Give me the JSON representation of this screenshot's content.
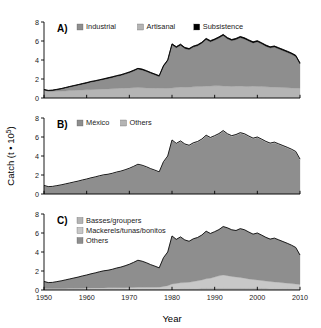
{
  "figure": {
    "xlabel": "Year",
    "ylabel_parts": {
      "main": "Catch (t ",
      "dot": "• 10",
      "exp": "5",
      "close": ")"
    },
    "ylabel_full": "Catch (t • 10⁵)",
    "x_ticks": [
      "1950",
      "1960",
      "1970",
      "1980",
      "1990",
      "2000",
      "2010"
    ],
    "x_tick_values": [
      1950,
      1960,
      1970,
      1980,
      1990,
      2000,
      2010
    ],
    "y_ticks": [
      "0",
      "2",
      "4",
      "6",
      "8"
    ],
    "y_tick_values": [
      0,
      2,
      4,
      6,
      8
    ],
    "xlim": [
      1950,
      2010
    ],
    "ylim": [
      0,
      8
    ],
    "grid": "off",
    "legend_position": "top-left inside panel"
  },
  "colors": {
    "fill_dark": "#7c7c7c",
    "fill_mid": "#8e8e8e",
    "fill_light": "#b4b4b4",
    "fill_lighter": "#c8c8c8",
    "black": "#000000",
    "axis": "#000000",
    "background": "#ffffff"
  },
  "chart_data": [
    {
      "type": "area",
      "panel": "A",
      "tag": "A)",
      "title": "",
      "xlabel": "",
      "ylabel": "Catch (t • 10⁵)",
      "xlim": [
        1950,
        2010
      ],
      "ylim": [
        0,
        8
      ],
      "stacked": true,
      "legend": [
        "Industrial",
        "Artisanal",
        "Subsistence"
      ],
      "legend_colors": [
        "#8e8e8e",
        "#b4b4b4",
        "#000000"
      ],
      "x": [
        1950,
        1951,
        1952,
        1953,
        1954,
        1955,
        1956,
        1957,
        1958,
        1959,
        1960,
        1961,
        1962,
        1963,
        1964,
        1965,
        1966,
        1967,
        1968,
        1969,
        1970,
        1971,
        1972,
        1973,
        1974,
        1975,
        1976,
        1977,
        1978,
        1979,
        1980,
        1981,
        1982,
        1983,
        1984,
        1985,
        1986,
        1987,
        1988,
        1989,
        1990,
        1991,
        1992,
        1993,
        1994,
        1995,
        1996,
        1997,
        1998,
        1999,
        2000,
        2001,
        2002,
        2003,
        2004,
        2005,
        2006,
        2007,
        2008,
        2009,
        2010
      ],
      "series": [
        {
          "name": "Artisanal",
          "color": "#b4b4b4",
          "values": [
            0.85,
            0.7,
            0.68,
            0.7,
            0.72,
            0.75,
            0.78,
            0.8,
            0.82,
            0.84,
            0.86,
            0.88,
            0.9,
            0.92,
            0.94,
            0.96,
            0.98,
            1.0,
            1.02,
            1.04,
            1.06,
            1.08,
            1.1,
            1.08,
            1.06,
            1.05,
            1.04,
            1.03,
            1.02,
            1.02,
            1.05,
            1.1,
            1.14,
            1.12,
            1.14,
            1.18,
            1.2,
            1.22,
            1.24,
            1.26,
            1.28,
            1.3,
            1.26,
            1.24,
            1.22,
            1.24,
            1.26,
            1.22,
            1.2,
            1.24,
            1.22,
            1.2,
            1.18,
            1.16,
            1.14,
            1.12,
            1.1,
            1.08,
            1.06,
            1.04,
            1.02
          ]
        },
        {
          "name": "Industrial",
          "color": "#8e8e8e",
          "values": [
            0.0,
            0.05,
            0.1,
            0.16,
            0.22,
            0.3,
            0.38,
            0.46,
            0.54,
            0.62,
            0.7,
            0.8,
            0.86,
            0.94,
            1.02,
            1.1,
            1.18,
            1.28,
            1.36,
            1.48,
            1.6,
            1.76,
            1.94,
            1.88,
            1.74,
            1.56,
            1.4,
            1.24,
            2.3,
            2.9,
            4.55,
            4.2,
            4.42,
            4.1,
            3.96,
            4.18,
            4.3,
            4.55,
            4.92,
            4.66,
            4.82,
            5.02,
            5.32,
            5.0,
            4.82,
            4.92,
            5.1,
            5.0,
            4.8,
            4.56,
            4.7,
            4.5,
            4.28,
            4.12,
            4.22,
            4.06,
            3.9,
            3.74,
            3.56,
            3.34,
            2.56
          ]
        },
        {
          "name": "Subsistence",
          "color": "#000000",
          "values": [
            0.05,
            0.05,
            0.05,
            0.05,
            0.05,
            0.05,
            0.05,
            0.05,
            0.05,
            0.06,
            0.06,
            0.06,
            0.06,
            0.06,
            0.06,
            0.07,
            0.07,
            0.07,
            0.07,
            0.07,
            0.08,
            0.08,
            0.08,
            0.08,
            0.08,
            0.08,
            0.08,
            0.08,
            0.09,
            0.09,
            0.1,
            0.1,
            0.1,
            0.1,
            0.1,
            0.1,
            0.1,
            0.1,
            0.11,
            0.11,
            0.11,
            0.11,
            0.11,
            0.11,
            0.11,
            0.11,
            0.11,
            0.11,
            0.11,
            0.11,
            0.11,
            0.11,
            0.11,
            0.11,
            0.11,
            0.11,
            0.11,
            0.11,
            0.11,
            0.11,
            0.11
          ]
        }
      ]
    },
    {
      "type": "area",
      "panel": "B",
      "tag": "B)",
      "title": "",
      "xlabel": "",
      "ylabel": "Catch (t • 10⁵)",
      "xlim": [
        1950,
        2010
      ],
      "ylim": [
        0,
        8
      ],
      "stacked": true,
      "legend": [
        "México",
        "Others"
      ],
      "legend_colors": [
        "#8e8e8e",
        "#b4b4b4"
      ],
      "x": [
        1950,
        1951,
        1952,
        1953,
        1954,
        1955,
        1956,
        1957,
        1958,
        1959,
        1960,
        1961,
        1962,
        1963,
        1964,
        1965,
        1966,
        1967,
        1968,
        1969,
        1970,
        1971,
        1972,
        1973,
        1974,
        1975,
        1976,
        1977,
        1978,
        1979,
        1980,
        1981,
        1982,
        1983,
        1984,
        1985,
        1986,
        1987,
        1988,
        1989,
        1990,
        1991,
        1992,
        1993,
        1994,
        1995,
        1996,
        1997,
        1998,
        1999,
        2000,
        2001,
        2002,
        2003,
        2004,
        2005,
        2006,
        2007,
        2008,
        2009,
        2010
      ],
      "series": [
        {
          "name": "México",
          "color": "#8e8e8e",
          "values": [
            0.86,
            0.74,
            0.76,
            0.84,
            0.92,
            1.02,
            1.12,
            1.22,
            1.32,
            1.44,
            1.54,
            1.66,
            1.76,
            1.88,
            1.98,
            2.04,
            2.14,
            2.26,
            2.36,
            2.5,
            2.66,
            2.86,
            3.08,
            2.98,
            2.82,
            2.62,
            2.46,
            2.28,
            3.34,
            3.94,
            5.62,
            5.26,
            5.52,
            5.2,
            5.06,
            5.32,
            5.46,
            5.72,
            6.12,
            5.88,
            6.06,
            6.28,
            6.6,
            6.26,
            6.06,
            6.18,
            6.38,
            6.26,
            6.02,
            5.8,
            5.92,
            5.7,
            5.46,
            5.28,
            5.38,
            5.2,
            5.02,
            4.84,
            4.64,
            4.4,
            3.6
          ]
        },
        {
          "name": "Others",
          "color": "#b4b4b4",
          "values": [
            0.04,
            0.04,
            0.04,
            0.04,
            0.04,
            0.04,
            0.04,
            0.04,
            0.04,
            0.04,
            0.04,
            0.04,
            0.04,
            0.04,
            0.04,
            0.04,
            0.04,
            0.05,
            0.05,
            0.05,
            0.05,
            0.05,
            0.05,
            0.05,
            0.05,
            0.05,
            0.05,
            0.05,
            0.06,
            0.06,
            0.07,
            0.07,
            0.07,
            0.07,
            0.07,
            0.07,
            0.07,
            0.07,
            0.07,
            0.07,
            0.08,
            0.08,
            0.08,
            0.08,
            0.08,
            0.08,
            0.08,
            0.08,
            0.08,
            0.08,
            0.08,
            0.08,
            0.08,
            0.08,
            0.08,
            0.08,
            0.08,
            0.08,
            0.08,
            0.08,
            0.08
          ]
        }
      ]
    },
    {
      "type": "area",
      "panel": "C",
      "tag": "C)",
      "title": "",
      "xlabel": "Year",
      "ylabel": "Catch (t • 10⁵)",
      "xlim": [
        1950,
        2010
      ],
      "ylim": [
        0,
        8
      ],
      "stacked": true,
      "legend": [
        "Basses/groupers",
        "Mackerels/tunas/bonitos",
        "Others"
      ],
      "legend_colors": [
        "#b4b4b4",
        "#c8c8c8",
        "#8e8e8e"
      ],
      "x": [
        1950,
        1951,
        1952,
        1953,
        1954,
        1955,
        1956,
        1957,
        1958,
        1959,
        1960,
        1961,
        1962,
        1963,
        1964,
        1965,
        1966,
        1967,
        1968,
        1969,
        1970,
        1971,
        1972,
        1973,
        1974,
        1975,
        1976,
        1977,
        1978,
        1979,
        1980,
        1981,
        1982,
        1983,
        1984,
        1985,
        1986,
        1987,
        1988,
        1989,
        1990,
        1991,
        1992,
        1993,
        1994,
        1995,
        1996,
        1997,
        1998,
        1999,
        2000,
        2001,
        2002,
        2003,
        2004,
        2005,
        2006,
        2007,
        2008,
        2009,
        2010
      ],
      "series": [
        {
          "name": "Basses/groupers",
          "color": "#b4b4b4",
          "values": [
            0.1,
            0.1,
            0.1,
            0.1,
            0.1,
            0.1,
            0.11,
            0.11,
            0.11,
            0.11,
            0.12,
            0.12,
            0.12,
            0.12,
            0.13,
            0.13,
            0.13,
            0.14,
            0.14,
            0.14,
            0.15,
            0.15,
            0.15,
            0.15,
            0.15,
            0.15,
            0.15,
            0.15,
            0.16,
            0.16,
            0.17,
            0.17,
            0.18,
            0.18,
            0.18,
            0.19,
            0.19,
            0.2,
            0.2,
            0.2,
            0.21,
            0.21,
            0.21,
            0.21,
            0.21,
            0.21,
            0.21,
            0.21,
            0.2,
            0.2,
            0.2,
            0.2,
            0.2,
            0.19,
            0.19,
            0.19,
            0.18,
            0.18,
            0.18,
            0.17,
            0.17
          ]
        },
        {
          "name": "Mackerels/tunas/bonitos",
          "color": "#c8c8c8",
          "values": [
            0.06,
            0.06,
            0.06,
            0.06,
            0.06,
            0.07,
            0.07,
            0.07,
            0.07,
            0.08,
            0.08,
            0.08,
            0.09,
            0.09,
            0.09,
            0.1,
            0.1,
            0.1,
            0.11,
            0.11,
            0.12,
            0.12,
            0.13,
            0.13,
            0.13,
            0.14,
            0.14,
            0.15,
            0.22,
            0.3,
            0.46,
            0.52,
            0.58,
            0.6,
            0.64,
            0.7,
            0.78,
            0.86,
            0.98,
            1.04,
            1.16,
            1.28,
            1.36,
            1.3,
            1.22,
            1.16,
            1.1,
            1.04,
            0.96,
            0.9,
            0.86,
            0.8,
            0.74,
            0.7,
            0.66,
            0.62,
            0.58,
            0.54,
            0.5,
            0.46,
            0.42
          ]
        },
        {
          "name": "Others",
          "color": "#8e8e8e",
          "values": [
            0.74,
            0.62,
            0.64,
            0.72,
            0.8,
            0.89,
            0.98,
            1.08,
            1.18,
            1.29,
            1.38,
            1.5,
            1.59,
            1.71,
            1.8,
            1.85,
            1.95,
            2.07,
            2.16,
            2.3,
            2.44,
            2.64,
            2.85,
            2.75,
            2.59,
            2.38,
            2.22,
            2.03,
            3.02,
            3.54,
            5.06,
            4.64,
            4.83,
            4.49,
            4.31,
            4.5,
            4.56,
            4.73,
            5.01,
            4.71,
            4.77,
            4.87,
            5.11,
            5.03,
            4.91,
            4.89,
            5.15,
            5.09,
            4.94,
            4.78,
            4.94,
            4.78,
            4.6,
            4.47,
            4.61,
            4.47,
            4.34,
            4.2,
            4.04,
            3.85,
            3.09
          ]
        }
      ]
    }
  ]
}
